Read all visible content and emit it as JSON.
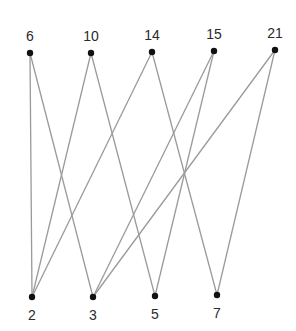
{
  "diagram": {
    "type": "bipartite-graph",
    "colors": {
      "edge": "#9a9a9a",
      "node": "#111111",
      "label": "#2a2a2a",
      "background": "#ffffff"
    },
    "top_nodes": [
      {
        "id": "6",
        "label": "6",
        "x": 30,
        "y": 53
      },
      {
        "id": "10",
        "label": "10",
        "x": 91,
        "y": 53
      },
      {
        "id": "14",
        "label": "14",
        "x": 152,
        "y": 52
      },
      {
        "id": "15",
        "label": "15",
        "x": 214,
        "y": 51
      },
      {
        "id": "21",
        "label": "21",
        "x": 275,
        "y": 50
      }
    ],
    "bottom_nodes": [
      {
        "id": "2",
        "label": "2",
        "x": 32,
        "y": 297
      },
      {
        "id": "3",
        "label": "3",
        "x": 93,
        "y": 297
      },
      {
        "id": "5",
        "label": "5",
        "x": 155,
        "y": 296
      },
      {
        "id": "7",
        "label": "7",
        "x": 217,
        "y": 295
      }
    ],
    "edges": [
      {
        "from": "6",
        "to": "2"
      },
      {
        "from": "6",
        "to": "3"
      },
      {
        "from": "10",
        "to": "2"
      },
      {
        "from": "10",
        "to": "5"
      },
      {
        "from": "14",
        "to": "2"
      },
      {
        "from": "14",
        "to": "7"
      },
      {
        "from": "15",
        "to": "3"
      },
      {
        "from": "15",
        "to": "5"
      },
      {
        "from": "21",
        "to": "3"
      },
      {
        "from": "21",
        "to": "7"
      }
    ]
  }
}
